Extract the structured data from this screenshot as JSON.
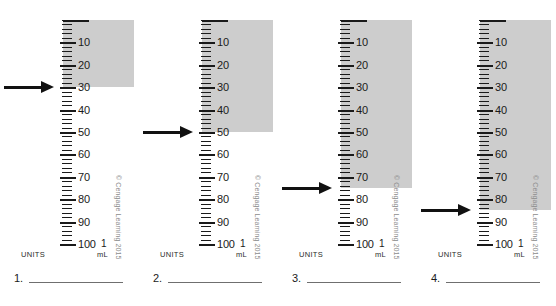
{
  "page": {
    "background_color": "#ffffff",
    "barrel_fill_color": "#cdcdcd",
    "ink_color": "#1a1a1a",
    "copyright": "© Cengage Learning 2015"
  },
  "scale": {
    "min": 0,
    "max": 100,
    "major_step": 10,
    "minor_step": 2,
    "major_labels": [
      "10",
      "20",
      "30",
      "40",
      "50",
      "60",
      "70",
      "80",
      "90",
      "100"
    ],
    "units_label": "UNITS",
    "volume_value": "1",
    "volume_label": "mL"
  },
  "problems": [
    {
      "number": "1.",
      "arrow_value": 30,
      "fill_to": 30,
      "answer": ""
    },
    {
      "number": "2.",
      "arrow_value": 50,
      "fill_to": 50,
      "answer": ""
    },
    {
      "number": "3.",
      "arrow_value": 75,
      "fill_to": 75,
      "answer": ""
    },
    {
      "number": "4.",
      "arrow_value": 85,
      "fill_to": 85,
      "answer": ""
    }
  ]
}
